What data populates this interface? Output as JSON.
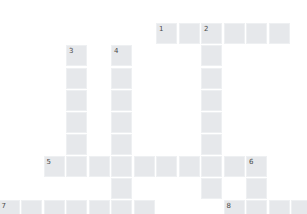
{
  "puzzle": {
    "cell_color": "#e6e8eb",
    "number_color": "#4a4a4a",
    "grid_origin": {
      "x": -1.5,
      "y": 23.3
    },
    "cell_pitch": {
      "x": 22.5,
      "y": 22.1
    },
    "words": [
      {
        "number": "1",
        "direction": "across",
        "row": 0,
        "col": 7,
        "length": 6
      },
      {
        "number": "2",
        "direction": "down",
        "row": 0,
        "col": 9,
        "length": 8
      },
      {
        "number": "3",
        "direction": "down",
        "row": 1,
        "col": 3,
        "length": 6
      },
      {
        "number": "4",
        "direction": "down",
        "row": 1,
        "col": 5,
        "length": 8
      },
      {
        "number": "5",
        "direction": "across",
        "row": 6,
        "col": 2,
        "length": 10
      },
      {
        "number": "6",
        "direction": "down",
        "row": 6,
        "col": 11,
        "length": 3
      },
      {
        "number": "7",
        "direction": "across",
        "row": 8,
        "col": 0,
        "length": 7
      },
      {
        "number": "8",
        "direction": "across",
        "row": 8,
        "col": 10,
        "length": 4
      }
    ]
  }
}
